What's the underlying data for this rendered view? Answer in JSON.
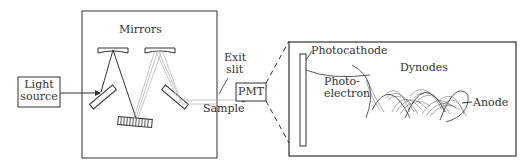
{
  "labels": {
    "light_source_line1": "Light",
    "light_source_line2": "source",
    "mirrors": "Mirrors",
    "exit_slit_line1": "Exit",
    "exit_slit_line2": "slit",
    "sample": "Sample",
    "pmt": "PMT",
    "photocathode": "Photocathode",
    "photoelectron_line1": "Photo-",
    "photoelectron_line2": "electron",
    "dynodes": "Dynodes",
    "anode": "Anode"
  },
  "colors": {
    "stroke": "#333333",
    "light_ray": "#b0b0b0",
    "text": "#333333"
  }
}
